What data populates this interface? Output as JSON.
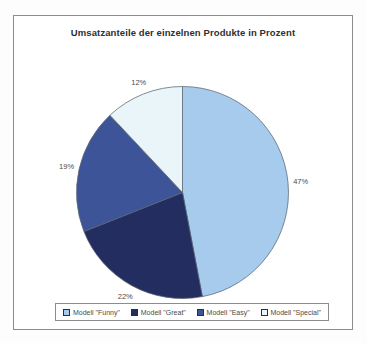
{
  "chart_data": {
    "type": "pie",
    "title": "Umsatzanteile der einzelnen Produkte in Prozent",
    "slices": [
      {
        "label": "Modell \"Funny\"",
        "value": 47,
        "data_label": "47%",
        "color": "#a7cbec"
      },
      {
        "label": "Modell \"Great\"",
        "value": 22,
        "data_label": "22%",
        "color": "#232d5f"
      },
      {
        "label": "Modell \"Easy\"",
        "value": 19,
        "data_label": "19%",
        "color": "#3d5499"
      },
      {
        "label": "Modell \"Special\"",
        "value": 12,
        "data_label": "12%",
        "color": "#e9f5f8"
      }
    ],
    "start_angle_deg": 0,
    "direction": "clockwise",
    "legend_position": "bottom",
    "data_labels_style": "percent-outside",
    "outline_color": "#5a6472",
    "frame_border_color": "#8c8c8c"
  }
}
